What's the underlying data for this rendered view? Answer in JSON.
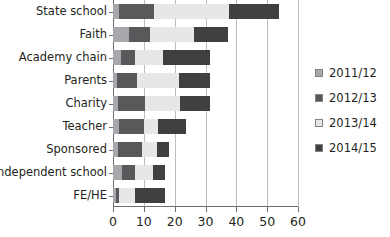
{
  "chart_data": {
    "type": "bar",
    "orientation": "horizontal",
    "stacked": true,
    "title": "",
    "subtitle": "",
    "xlabel": "",
    "ylabel": "",
    "grid": true,
    "legend_position": "right",
    "xlim": [
      0,
      60
    ],
    "xticks": [
      0,
      10,
      20,
      30,
      40,
      50,
      60
    ],
    "xtick_labels": [
      "0",
      "10",
      "20",
      "30",
      "40",
      "50",
      "60"
    ],
    "categories": [
      "State school",
      "Faith",
      "Academy chain",
      "Parents",
      "Charity",
      "Teacher",
      "Sponsored",
      "Independent school",
      "FE/HE"
    ],
    "series": [
      {
        "name": "2011/12",
        "color": "#a6a8ab",
        "values": [
          2.0,
          5.2,
          2.6,
          1.3,
          1.6,
          2.0,
          1.6,
          2.9,
          1.0
        ]
      },
      {
        "name": "2012/13",
        "color": "#58595b",
        "values": [
          11.3,
          6.8,
          4.5,
          6.5,
          8.8,
          8.0,
          7.8,
          4.2,
          1.0
        ]
      },
      {
        "name": "2013/14",
        "color": "#e6e7e8",
        "values": [
          24.4,
          14.3,
          9.2,
          13.6,
          11.3,
          4.6,
          4.9,
          5.9,
          5.1
        ]
      },
      {
        "name": "2014/15",
        "color": "#404041",
        "values": [
          16.3,
          11.0,
          15.2,
          10.1,
          9.8,
          9.1,
          3.9,
          3.9,
          9.8
        ]
      }
    ],
    "totals": [
      54.0,
      37.3,
      31.5,
      31.5,
      31.5,
      23.7,
      18.2,
      16.9,
      16.9
    ]
  }
}
